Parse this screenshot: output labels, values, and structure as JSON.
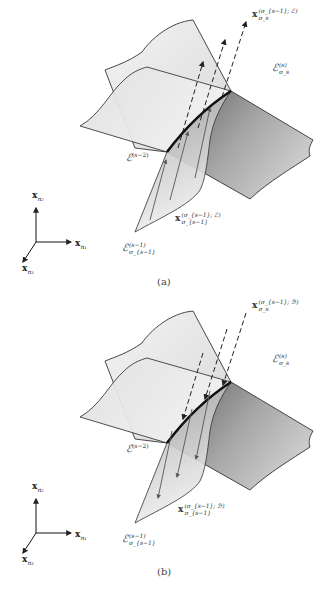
{
  "figure": {
    "panels": [
      {
        "id": "a",
        "caption": "(a)",
        "arrow_direction": "upward",
        "labels": {
          "top_vector": {
            "base": "x",
            "sup": "(σ_{s−1}; ℰ)",
            "sub": "σ_s"
          },
          "right_surface": {
            "base": "ℰ",
            "sup": "(s)",
            "sub": "σ_s"
          },
          "crease": {
            "base": "ℰ",
            "sup": "(s−2)"
          },
          "bottom_vector": {
            "base": "x",
            "sup": "(σ_{s−1}; ℰ)",
            "sub": "σ_{s−1}"
          },
          "bottom_surface": {
            "base": "ℰ",
            "sup": "(s−1)",
            "sub": "σ_{s−1}"
          }
        },
        "axes": {
          "up": "x",
          "up_sub": "n₂",
          "right": "x",
          "right_sub": "n₁",
          "down_left": "x",
          "down_left_sub": "n₃"
        }
      },
      {
        "id": "b",
        "caption": "(b)",
        "arrow_direction": "downward",
        "labels": {
          "top_vector": {
            "base": "x",
            "sup": "(σ_{s−1}; ℬ)",
            "sub": "σ_s"
          },
          "right_surface": {
            "base": "ℰ",
            "sup": "(s)",
            "sub": "σ_s"
          },
          "crease": {
            "base": "ℰ",
            "sup": "(s−2)"
          },
          "bottom_vector": {
            "base": "x",
            "sup": "(σ_{s−1}; ℬ)",
            "sub": "σ_{s−1}"
          },
          "bottom_surface": {
            "base": "ℰ",
            "sup": "(s−1)",
            "sub": "σ_{s−1}"
          }
        },
        "axes": {
          "up": "x",
          "up_sub": "n₂",
          "right": "x",
          "right_sub": "n₁",
          "down_left": "x",
          "down_left_sub": "n₃"
        }
      }
    ],
    "colors": {
      "line": "#333333",
      "surface_light": "#e8e8e8",
      "surface_dark": "#7a7a7a",
      "crease": "#111111"
    }
  }
}
